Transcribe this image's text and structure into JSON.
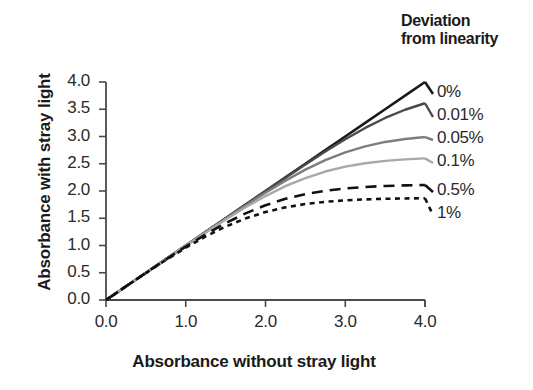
{
  "chart_data": {
    "type": "line",
    "title": "",
    "xlabel": "Absorbance without stray light",
    "ylabel": "Absorbance with stray light",
    "xlim": [
      0.0,
      4.0
    ],
    "ylim": [
      0.0,
      4.0
    ],
    "xticks": [
      "0.0",
      "1.0",
      "2.0",
      "3.0",
      "4.0"
    ],
    "yticks": [
      "0.0",
      "0.5",
      "1.0",
      "1.5",
      "2.0",
      "2.5",
      "3.0",
      "3.5",
      "4.0"
    ],
    "xtick_values": [
      0.0,
      1.0,
      2.0,
      3.0,
      4.0
    ],
    "ytick_values": [
      0.0,
      0.5,
      1.0,
      1.5,
      2.0,
      2.5,
      3.0,
      3.5,
      4.0
    ],
    "grid": false,
    "legend_title": "Deviation from linearity",
    "legend_position": "right",
    "x": [
      0.0,
      0.25,
      0.5,
      0.75,
      1.0,
      1.25,
      1.5,
      1.75,
      2.0,
      2.25,
      2.5,
      2.75,
      3.0,
      3.25,
      3.5,
      3.75,
      4.0
    ],
    "series": [
      {
        "name": "0%",
        "stray_light_fraction": 0.0,
        "color": "#1a1a1a",
        "style": "solid",
        "width": 2.6,
        "values": [
          0.0,
          0.25,
          0.5,
          0.75,
          1.0,
          1.25,
          1.5,
          1.75,
          2.0,
          2.25,
          2.5,
          2.75,
          3.0,
          3.25,
          3.5,
          3.75,
          4.0
        ]
      },
      {
        "name": "0.01%",
        "stray_light_fraction": 0.0001,
        "color": "#4a4a4a",
        "style": "solid",
        "width": 2.4,
        "values": [
          0.0,
          0.25,
          0.5,
          0.75,
          1.0,
          1.25,
          1.5,
          1.749,
          1.998,
          2.245,
          2.488,
          2.725,
          2.95,
          3.157,
          3.34,
          3.491,
          3.61
        ]
      },
      {
        "name": "0.05%",
        "stray_light_fraction": 0.0005,
        "color": "#7d7d7d",
        "style": "solid",
        "width": 2.4,
        "values": [
          0.0,
          0.25,
          0.5,
          0.749,
          0.999,
          1.247,
          1.493,
          1.735,
          1.969,
          2.19,
          2.392,
          2.566,
          2.71,
          2.82,
          2.9,
          2.955,
          2.99
        ]
      },
      {
        "name": "0.1%",
        "stray_light_fraction": 0.001,
        "color": "#a8a8a8",
        "style": "solid",
        "width": 2.4,
        "values": [
          0.0,
          0.25,
          0.499,
          0.748,
          0.996,
          1.24,
          1.477,
          1.702,
          1.907,
          2.088,
          2.238,
          2.357,
          2.446,
          2.51,
          2.553,
          2.581,
          2.599
        ]
      },
      {
        "name": "0.5%",
        "stray_light_fraction": 0.005,
        "color": "#111111",
        "style": "dashed",
        "width": 2.6,
        "dash": "11,7",
        "values": [
          0.0,
          0.249,
          0.497,
          0.741,
          0.979,
          1.204,
          1.41,
          1.59,
          1.739,
          1.856,
          1.943,
          2.004,
          2.046,
          2.074,
          2.092,
          2.103,
          2.11
        ]
      },
      {
        "name": "1%",
        "stray_light_fraction": 0.01,
        "color": "#111111",
        "style": "dotted",
        "width": 2.6,
        "dash": "5,4.5",
        "values": [
          0.0,
          0.249,
          0.494,
          0.733,
          0.959,
          1.166,
          1.347,
          1.497,
          1.614,
          1.7,
          1.761,
          1.802,
          1.829,
          1.846,
          1.857,
          1.863,
          1.867
        ]
      }
    ]
  },
  "axes": {
    "y_title": "Absorbance with stray light",
    "x_title": "Absorbance without stray light"
  },
  "legend": {
    "title_line1": "Deviation",
    "title_line2": "from linearity",
    "items": [
      {
        "label": "0%"
      },
      {
        "label": "0.01%"
      },
      {
        "label": "0.05%"
      },
      {
        "label": "0.1%"
      },
      {
        "label": "0.5%"
      },
      {
        "label": "1%"
      }
    ]
  }
}
